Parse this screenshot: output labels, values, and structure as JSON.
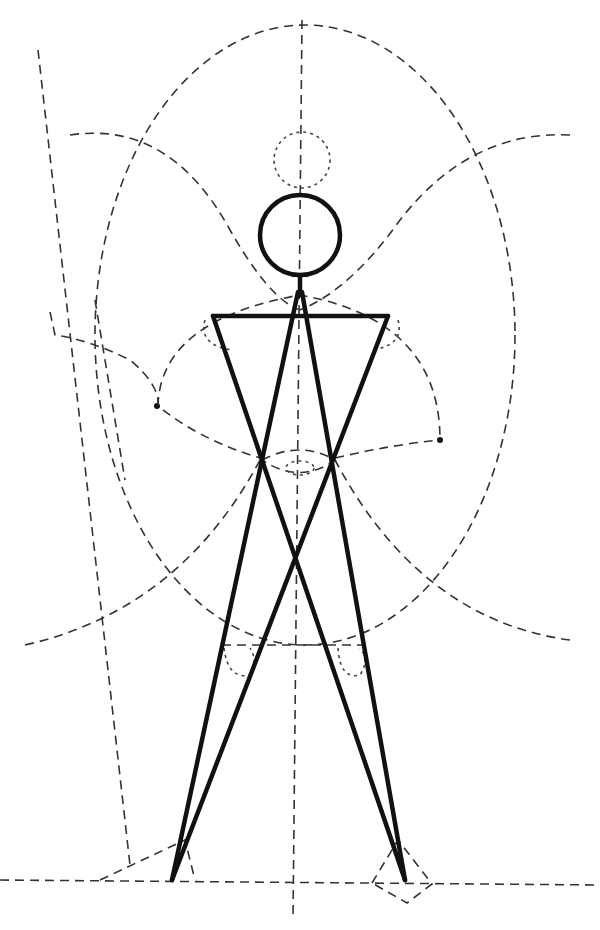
{
  "figure": {
    "colors": {
      "ink": "#111111",
      "construction": "#333333",
      "background": "#ffffff"
    }
  }
}
